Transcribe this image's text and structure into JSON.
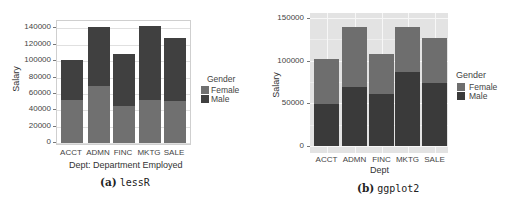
{
  "chart_data": [
    {
      "type": "bar",
      "stacked": true,
      "title": "",
      "caption": {
        "prefix": "(a)",
        "name": "lessR"
      },
      "categories": [
        "ACCT",
        "ADMN",
        "FINC",
        "MKTG",
        "SALE"
      ],
      "series": [
        {
          "name": "Female",
          "values": [
            52500,
            69700,
            45200,
            52500,
            51300
          ],
          "color": "#707070"
        },
        {
          "name": "Male",
          "values": [
            49000,
            72100,
            63600,
            90500,
            77100
          ],
          "color": "#404040"
        }
      ],
      "totals": [
        101500,
        141800,
        108800,
        143000,
        128400
      ],
      "xlabel": "Dept: Department Employed",
      "ylabel": "Salary",
      "ylim": [
        0,
        150000
      ],
      "yticks": [
        "0",
        "20000",
        "40000",
        "60000",
        "80000",
        "100000",
        "120000",
        "140000"
      ],
      "grid": true,
      "legend": {
        "title": "Gender",
        "position": "right",
        "entries": [
          "Female",
          "Male"
        ]
      }
    },
    {
      "type": "bar",
      "stacked": true,
      "title": "",
      "caption": {
        "prefix": "(b)",
        "name": "ggplot2"
      },
      "categories": [
        "ACCT",
        "ADMN",
        "FINC",
        "MKTG",
        "SALE"
      ],
      "series": [
        {
          "name": "Female",
          "values": [
            53000,
            70500,
            47000,
            53000,
            53000
          ],
          "color": "#6e6e6e"
        },
        {
          "name": "Male",
          "values": [
            49000,
            69000,
            61000,
            87000,
            74000
          ],
          "color": "#3a3a3a"
        }
      ],
      "totals": [
        102000,
        139500,
        108000,
        140000,
        127000
      ],
      "xlabel": "Dept",
      "ylabel": "Salary",
      "ylim": [
        0,
        155000
      ],
      "yticks": [
        "0",
        "50000",
        "100000",
        "150000"
      ],
      "grid": true,
      "legend": {
        "title": "Gender",
        "position": "right",
        "entries": [
          "Female",
          "Male"
        ]
      }
    }
  ]
}
